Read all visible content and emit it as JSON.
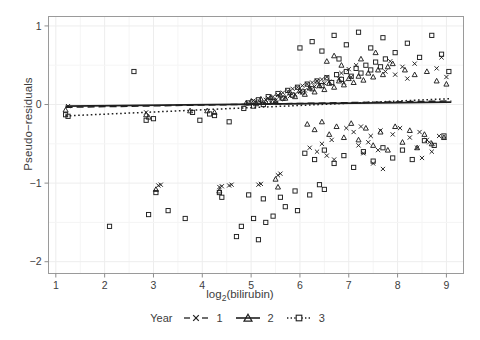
{
  "axes": {
    "ylabel": "Pseudo−residuals",
    "xlabel_main": "log",
    "xlabel_sub": "2",
    "xlabel_tail": "(bilirubin)",
    "xticks": [
      "1",
      "2",
      "3",
      "4",
      "5",
      "6",
      "7",
      "8",
      "9"
    ],
    "yticks": [
      "1",
      "0",
      "−1",
      "−2"
    ]
  },
  "legend": {
    "title": "Year",
    "entries": [
      {
        "label": "1",
        "marker": "cross-marker",
        "line": "dashed",
        "key": "legend-key-year-1"
      },
      {
        "label": "2",
        "marker": "triangle-marker",
        "line": "solid",
        "key": "legend-key-year-2"
      },
      {
        "label": "3",
        "marker": "square-marker",
        "line": "dotted",
        "key": "legend-key-year-3"
      }
    ]
  },
  "colors": {
    "ink": "#1f1f1f",
    "grid": "#ededed",
    "panel_border": "#9a9a9a",
    "text": "#3d3d3d"
  },
  "chart_data": {
    "type": "scatter",
    "title": "",
    "xlabel": "log2(bilirubin)",
    "ylabel": "Pseudo-residuals",
    "xlim": [
      0.85,
      9.35
    ],
    "ylim": [
      -2.15,
      1.12
    ],
    "grid": true,
    "legend_position": "bottom",
    "legend_title": "Year",
    "series": [
      {
        "name": "1",
        "marker": "cross",
        "line": "dashed",
        "points": [
          [
            1.25,
            -0.02
          ],
          [
            2.85,
            -0.1
          ],
          [
            3.1,
            -1.03
          ],
          [
            3.15,
            -1.02
          ],
          [
            4.35,
            -1.05
          ],
          [
            4.4,
            -1.04
          ],
          [
            4.55,
            -1.03
          ],
          [
            4.6,
            -1.02
          ],
          [
            5.15,
            -1.02
          ],
          [
            5.2,
            -1.01
          ],
          [
            5.55,
            -0.9
          ],
          [
            5.6,
            -0.88
          ],
          [
            5.05,
            0.05
          ],
          [
            5.1,
            0.04
          ],
          [
            5.2,
            0.02
          ],
          [
            5.3,
            0.06
          ],
          [
            5.35,
            0.08
          ],
          [
            5.4,
            0.03
          ],
          [
            5.45,
            0.1
          ],
          [
            5.5,
            0.05
          ],
          [
            5.55,
            0.12
          ],
          [
            5.6,
            0.07
          ],
          [
            5.65,
            0.15
          ],
          [
            5.7,
            0.09
          ],
          [
            5.75,
            0.17
          ],
          [
            5.8,
            0.11
          ],
          [
            5.85,
            0.2
          ],
          [
            5.9,
            0.13
          ],
          [
            5.95,
            0.22
          ],
          [
            6.0,
            0.16
          ],
          [
            6.05,
            0.24
          ],
          [
            6.1,
            0.18
          ],
          [
            6.15,
            0.26
          ],
          [
            6.2,
            0.21
          ],
          [
            6.25,
            0.28
          ],
          [
            6.3,
            0.23
          ],
          [
            6.35,
            0.3
          ],
          [
            6.4,
            0.25
          ],
          [
            6.45,
            0.32
          ],
          [
            6.5,
            0.27
          ],
          [
            6.55,
            0.35
          ],
          [
            6.6,
            0.29
          ],
          [
            6.2,
            -0.55
          ],
          [
            6.35,
            -0.6
          ],
          [
            6.45,
            -0.5
          ],
          [
            6.55,
            -0.65
          ],
          [
            6.65,
            -0.45
          ],
          [
            6.7,
            -0.7
          ],
          [
            6.8,
            0.33
          ],
          [
            6.85,
            0.4
          ],
          [
            6.9,
            0.28
          ],
          [
            7.0,
            0.45
          ],
          [
            7.05,
            0.35
          ],
          [
            7.15,
            0.5
          ],
          [
            7.2,
            -0.52
          ],
          [
            7.3,
            -0.62
          ],
          [
            7.4,
            -0.48
          ],
          [
            7.5,
            -0.75
          ],
          [
            7.6,
            -0.58
          ],
          [
            7.7,
            -0.82
          ],
          [
            7.75,
            0.42
          ],
          [
            7.85,
            0.55
          ],
          [
            7.95,
            0.38
          ],
          [
            8.1,
            0.48
          ],
          [
            8.2,
            0.33
          ],
          [
            8.35,
            0.52
          ],
          [
            8.4,
            -0.55
          ],
          [
            8.5,
            -0.68
          ],
          [
            8.6,
            -0.45
          ],
          [
            8.7,
            -0.6
          ],
          [
            8.8,
            0.46
          ],
          [
            8.9,
            0.6
          ],
          [
            6.95,
            -0.3
          ],
          [
            7.1,
            -0.35
          ],
          [
            7.25,
            -0.28
          ],
          [
            7.45,
            -0.4
          ],
          [
            7.65,
            -0.33
          ],
          [
            7.9,
            -0.38
          ],
          [
            8.05,
            -0.3
          ],
          [
            8.25,
            -0.42
          ],
          [
            8.45,
            -0.35
          ],
          [
            8.65,
            -0.48
          ],
          [
            8.85,
            -0.4
          ],
          [
            9.0,
            0.35
          ]
        ]
      },
      {
        "name": "2",
        "marker": "triangle",
        "line": "solid",
        "points": [
          [
            1.2,
            -0.07
          ],
          [
            2.85,
            -0.13
          ],
          [
            2.9,
            -0.16
          ],
          [
            3.75,
            -0.08
          ],
          [
            4.1,
            -0.08
          ],
          [
            4.25,
            -0.1
          ],
          [
            3.05,
            -1.08
          ],
          [
            4.35,
            -1.1
          ],
          [
            5.5,
            -0.95
          ],
          [
            5.55,
            -1.05
          ],
          [
            4.9,
            0.02
          ],
          [
            5.0,
            0.04
          ],
          [
            5.1,
            0.01
          ],
          [
            5.2,
            0.07
          ],
          [
            5.3,
            0.03
          ],
          [
            5.4,
            0.09
          ],
          [
            5.5,
            0.05
          ],
          [
            5.6,
            0.12
          ],
          [
            5.7,
            0.08
          ],
          [
            5.8,
            0.15
          ],
          [
            5.9,
            0.1
          ],
          [
            6.0,
            0.18
          ],
          [
            6.1,
            0.13
          ],
          [
            6.2,
            0.21
          ],
          [
            6.3,
            0.16
          ],
          [
            6.4,
            0.24
          ],
          [
            6.5,
            0.19
          ],
          [
            6.6,
            0.27
          ],
          [
            6.7,
            0.22
          ],
          [
            6.8,
            0.3
          ],
          [
            6.9,
            0.25
          ],
          [
            7.0,
            0.33
          ],
          [
            7.1,
            0.28
          ],
          [
            7.2,
            0.36
          ],
          [
            7.3,
            0.31
          ],
          [
            7.4,
            0.4
          ],
          [
            7.5,
            0.35
          ],
          [
            7.6,
            0.44
          ],
          [
            7.7,
            0.38
          ],
          [
            7.8,
            0.48
          ],
          [
            6.15,
            -0.25
          ],
          [
            6.3,
            -0.32
          ],
          [
            6.45,
            -0.22
          ],
          [
            6.6,
            -0.38
          ],
          [
            6.75,
            -0.28
          ],
          [
            6.9,
            -0.42
          ],
          [
            7.05,
            -0.24
          ],
          [
            7.2,
            -0.45
          ],
          [
            7.35,
            -0.3
          ],
          [
            7.5,
            -0.52
          ],
          [
            7.65,
            -0.35
          ],
          [
            7.8,
            -0.58
          ],
          [
            7.95,
            -0.28
          ],
          [
            8.1,
            -0.48
          ],
          [
            8.25,
            -0.33
          ],
          [
            8.4,
            -0.55
          ],
          [
            8.55,
            -0.38
          ],
          [
            8.7,
            -0.5
          ],
          [
            6.55,
            0.55
          ],
          [
            6.7,
            0.62
          ],
          [
            6.85,
            0.5
          ],
          [
            7.25,
            0.58
          ],
          [
            7.55,
            0.66
          ],
          [
            7.9,
            0.52
          ],
          [
            8.15,
            0.44
          ],
          [
            8.35,
            0.38
          ],
          [
            8.6,
            0.42
          ],
          [
            8.8,
            0.3
          ],
          [
            9.0,
            0.26
          ],
          [
            8.95,
            -0.42
          ]
        ]
      },
      {
        "name": "3",
        "marker": "square",
        "line": "dotted",
        "points": [
          [
            1.2,
            -0.13
          ],
          [
            1.25,
            -0.15
          ],
          [
            2.1,
            -1.55
          ],
          [
            2.85,
            -0.2
          ],
          [
            2.9,
            -1.4
          ],
          [
            3.05,
            -1.12
          ],
          [
            3.3,
            -1.35
          ],
          [
            3.65,
            -1.45
          ],
          [
            3.0,
            -0.18
          ],
          [
            3.8,
            -0.1
          ],
          [
            4.15,
            -0.12
          ],
          [
            4.25,
            -0.14
          ],
          [
            4.35,
            -1.12
          ],
          [
            4.4,
            -1.18
          ],
          [
            4.85,
            -0.05
          ],
          [
            4.95,
            0.02
          ],
          [
            5.05,
            -0.02
          ],
          [
            5.15,
            0.06
          ],
          [
            5.25,
            0.0
          ],
          [
            5.35,
            0.1
          ],
          [
            5.45,
            0.04
          ],
          [
            5.55,
            0.14
          ],
          [
            5.65,
            0.08
          ],
          [
            5.75,
            0.18
          ],
          [
            5.85,
            0.12
          ],
          [
            5.95,
            0.22
          ],
          [
            6.05,
            0.16
          ],
          [
            6.15,
            0.26
          ],
          [
            6.25,
            0.2
          ],
          [
            6.35,
            0.3
          ],
          [
            6.45,
            0.24
          ],
          [
            6.55,
            0.34
          ],
          [
            6.65,
            0.28
          ],
          [
            6.75,
            0.38
          ],
          [
            6.85,
            0.32
          ],
          [
            6.95,
            0.42
          ],
          [
            7.05,
            0.36
          ],
          [
            7.15,
            0.46
          ],
          [
            7.25,
            0.4
          ],
          [
            7.35,
            0.5
          ],
          [
            7.45,
            0.44
          ],
          [
            7.55,
            0.54
          ],
          [
            7.65,
            0.48
          ],
          [
            7.75,
            0.58
          ],
          [
            4.8,
            -1.55
          ],
          [
            5.05,
            -1.45
          ],
          [
            5.3,
            -1.5
          ],
          [
            5.45,
            -1.42
          ],
          [
            5.7,
            -1.3
          ],
          [
            5.95,
            -1.35
          ],
          [
            4.95,
            -1.15
          ],
          [
            5.25,
            -1.2
          ],
          [
            5.6,
            -1.18
          ],
          [
            5.9,
            -1.1
          ],
          [
            6.2,
            -1.15
          ],
          [
            6.5,
            -1.08
          ],
          [
            6.1,
            -0.62
          ],
          [
            6.3,
            -0.7
          ],
          [
            6.5,
            -0.58
          ],
          [
            6.7,
            -0.75
          ],
          [
            6.9,
            -0.65
          ],
          [
            7.1,
            -0.8
          ],
          [
            7.3,
            -0.6
          ],
          [
            7.5,
            -0.72
          ],
          [
            7.7,
            -0.55
          ],
          [
            7.9,
            -0.68
          ],
          [
            8.1,
            -0.58
          ],
          [
            8.3,
            -0.7
          ],
          [
            6.0,
            0.72
          ],
          [
            6.25,
            0.8
          ],
          [
            6.45,
            0.68
          ],
          [
            6.7,
            0.88
          ],
          [
            6.95,
            0.76
          ],
          [
            7.2,
            0.92
          ],
          [
            7.45,
            0.72
          ],
          [
            7.7,
            0.85
          ],
          [
            7.95,
            0.66
          ],
          [
            8.2,
            0.78
          ],
          [
            8.45,
            0.6
          ],
          [
            8.7,
            0.88
          ],
          [
            8.9,
            0.64
          ],
          [
            9.05,
            0.42
          ],
          [
            8.55,
            -0.46
          ],
          [
            8.75,
            -0.52
          ],
          [
            8.95,
            -0.4
          ],
          [
            6.8,
            0.58
          ],
          [
            2.6,
            0.42
          ],
          [
            3.95,
            -0.2
          ],
          [
            4.55,
            -0.22
          ],
          [
            4.7,
            -1.68
          ],
          [
            5.15,
            -1.72
          ],
          [
            6.4,
            -1.02
          ]
        ]
      }
    ],
    "trend_lines": [
      {
        "name": "1",
        "style": "dashed",
        "x": [
          1.2,
          9.1
        ],
        "y": [
          -0.035,
          0.045
        ]
      },
      {
        "name": "2",
        "style": "solid",
        "x": [
          1.2,
          9.1
        ],
        "y": [
          -0.02,
          0.03
        ]
      },
      {
        "name": "3",
        "style": "dotted",
        "x": [
          1.2,
          9.1
        ],
        "y": [
          -0.145,
          0.075
        ]
      }
    ]
  }
}
